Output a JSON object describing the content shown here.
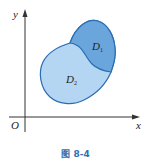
{
  "figure": {
    "caption": "图 8-4",
    "axes": {
      "x_label": "x",
      "y_label": "y",
      "origin_label": "O"
    },
    "regions": [
      {
        "name": "D1",
        "label_main": "D",
        "label_sub": "1",
        "color": "#6aa6dc"
      },
      {
        "name": "D2",
        "label_main": "D",
        "label_sub": "2",
        "color": "#b4d6f2"
      }
    ],
    "colors": {
      "outline": "#2a6db5",
      "axis": "#333333"
    }
  }
}
